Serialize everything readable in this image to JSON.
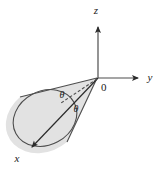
{
  "figure": {
    "caption": "Right circular cone with apex at the origin, axis tilted into the negative x/y octant, half-angle theta marked on both sides of the dashed cone axis.",
    "background_color": "#ffffff",
    "stroke_color": "#4d4d4d",
    "dark_stroke_color": "#2b2b2b",
    "cone_fill_color": "#e2e2e2",
    "text_color": "#1a1a1a"
  },
  "axes": [
    {
      "id": "z",
      "label": "z",
      "label_x": 96,
      "label_y": 14,
      "line": {
        "x1": 98,
        "y1": 78,
        "x2": 98,
        "y2": 27
      },
      "arrow": "up",
      "style": "solid"
    },
    {
      "id": "y",
      "label": "y",
      "label_x": 150,
      "label_y": 81,
      "line": {
        "x1": 98,
        "y1": 78,
        "x2": 138,
        "y2": 78
      },
      "arrow": "right",
      "style": "solid"
    },
    {
      "id": "x",
      "label": "x",
      "label_x": 17,
      "label_y": 162,
      "line": {
        "x1": 98,
        "y1": 78,
        "x2": 32,
        "y2": 147
      },
      "arrow": "down-left",
      "style": "solid"
    }
  ],
  "origin": {
    "label": "0",
    "label_x": 101,
    "label_y": 91,
    "x": 98,
    "y": 78
  },
  "cone": {
    "apex": {
      "x": 98,
      "y": 78
    },
    "base_ellipse": {
      "cx": 45,
      "cy": 118,
      "rx": 33,
      "ry": 27,
      "rotation_deg": -28
    },
    "axis_dashed": {
      "x1": 97,
      "y1": 79,
      "x2": 61,
      "y2": 103,
      "dash_pattern": "3 2"
    },
    "upper_generator": {
      "x1": 97,
      "y1": 78,
      "x2": 20,
      "y2": 97
    },
    "lower_generator": {
      "x1": 97,
      "y1": 78,
      "x2": 67,
      "y2": 142
    }
  },
  "angle_labels": [
    {
      "id": "theta-upper",
      "text": "θ",
      "x": 62,
      "y": 98
    },
    {
      "id": "theta-lower",
      "text": "θ",
      "x": 76,
      "y": 112
    }
  ]
}
